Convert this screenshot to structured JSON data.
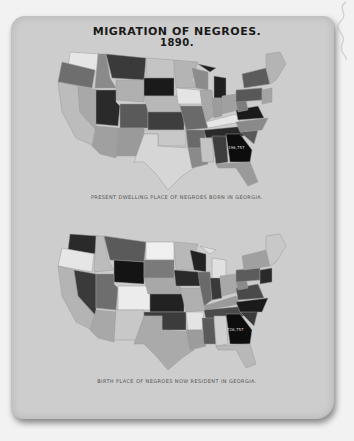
{
  "title": {
    "line1": "MIGRATION OF NEGROES.",
    "line2": "1890."
  },
  "maps": [
    {
      "id": "present-dwelling",
      "caption": "PRESENT DWELLING PLACE OF NEGROES BORN IN GEORGIA.",
      "highlight_state": "Georgia",
      "highlight_label": "196,757"
    },
    {
      "id": "birth-place",
      "caption": "BIRTH PLACE OF NEGROES NOW RESIDENT IN GEORGIA.",
      "highlight_state": "Georgia",
      "highlight_label": "726,757"
    }
  ],
  "colors": {
    "background": "#f2f2f2",
    "plate": "#cdcdcd",
    "georgia": "#0d0d0d"
  }
}
